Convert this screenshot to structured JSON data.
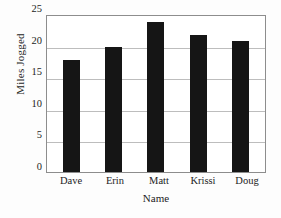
{
  "chart_data": {
    "type": "bar",
    "title": "",
    "xlabel": "Name",
    "ylabel": "Miles Jogged",
    "categories": [
      "Dave",
      "Erin",
      "Matt",
      "Krissi",
      "Doug"
    ],
    "values": [
      18,
      20,
      24,
      22,
      21
    ],
    "ylim": [
      0,
      25
    ],
    "yticks": [
      0,
      5,
      10,
      15,
      20,
      25
    ],
    "ytick_labels": [
      "0",
      "5",
      "10",
      "15",
      "20",
      "25"
    ],
    "grid": true,
    "grid_axis": "y",
    "legend": false,
    "legend_position": "none",
    "series": [
      {
        "name": "Miles Jogged",
        "values": [
          18,
          20,
          24,
          22,
          21
        ],
        "color": "#151515"
      }
    ],
    "colors": {
      "bar": "#151515",
      "gridline": "#bdbdbd",
      "axis_border": "#8d8d8d",
      "text": "#1c1c1c",
      "background": "#ffffff"
    }
  }
}
